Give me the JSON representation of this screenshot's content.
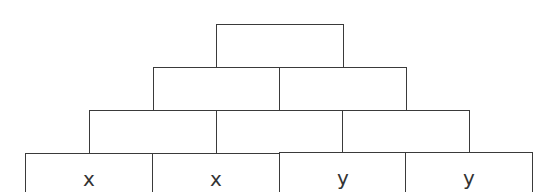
{
  "diagram": {
    "type": "number-pyramid",
    "rows": [
      {
        "name": "row-1-top",
        "cells": [
          ""
        ]
      },
      {
        "name": "row-2",
        "cells": [
          "",
          ""
        ]
      },
      {
        "name": "row-3",
        "cells": [
          "",
          "",
          ""
        ]
      },
      {
        "name": "row-4-base",
        "cells": [
          "x",
          "x",
          "y",
          "y"
        ]
      }
    ]
  }
}
